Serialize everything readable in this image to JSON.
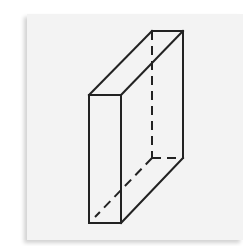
{
  "figure": {
    "type": "rectangular-prism",
    "projection": "oblique",
    "stroke_color": "#222222",
    "background_color": "#f3f3f3",
    "vertices": {
      "front_top_left": [
        89,
        95
      ],
      "front_top_right": [
        121,
        95
      ],
      "front_bottom_left": [
        89,
        223
      ],
      "front_bottom_right": [
        121,
        223
      ],
      "back_top_left": [
        152,
        31
      ],
      "back_top_right": [
        183,
        31
      ],
      "back_bottom_left": [
        152,
        158
      ],
      "back_bottom_right": [
        183,
        158
      ]
    },
    "visible_edges": 9,
    "hidden_edges": 3
  }
}
